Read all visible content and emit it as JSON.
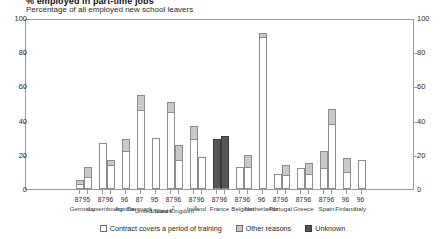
{
  "header": {
    "title_clipped": "% employed in part-time jobs",
    "subtitle": "Percentage of all employed new school leavers"
  },
  "legend": {
    "items": [
      {
        "label": "Contract covers a period of training",
        "swatch": "white",
        "color": "#ffffff"
      },
      {
        "label": "Other reasons",
        "swatch": "gray",
        "color": "#c9c9c9"
      },
      {
        "label": "Unknown",
        "swatch": "dark",
        "color": "#565656"
      }
    ]
  },
  "chart_data": {
    "type": "bar",
    "title": "% employed in part-time jobs",
    "subtitle": "Percentage of all employed new school leavers",
    "xlabel": "",
    "ylabel": "Percentage of all employed new school leavers",
    "ylim": [
      0,
      100
    ],
    "yticks": [
      0,
      20,
      40,
      60,
      80,
      100
    ],
    "ylim_right": [
      0,
      100
    ],
    "yticks_right": [
      0,
      20,
      40,
      60,
      80,
      100
    ],
    "grid": false,
    "stacked": true,
    "legend_position": "bottom",
    "series": [
      {
        "name": "Contract covers a period of training",
        "color": "#ffffff"
      },
      {
        "name": "Other reasons",
        "color": "#c9c9c9"
      },
      {
        "name": "Unknown",
        "color": "#565656"
      }
    ],
    "groups": [
      {
        "country": "Germany",
        "bars": [
          {
            "year": "87",
            "training": 3,
            "other": 2,
            "unknown": 0,
            "total": 5
          },
          {
            "year": "95",
            "training": 7,
            "other": 6,
            "unknown": 0,
            "total": 13
          }
        ]
      },
      {
        "country": "Luxembourg",
        "bars": [
          {
            "year": "87",
            "training": 27,
            "other": 0,
            "unknown": 0,
            "total": 27
          },
          {
            "year": "96",
            "training": 14,
            "other": 3,
            "unknown": 0,
            "total": 17
          }
        ]
      },
      {
        "country": "Austria",
        "bars": [
          {
            "year": "96",
            "training": 22,
            "other": 7,
            "unknown": 0,
            "total": 29
          }
        ]
      },
      {
        "country": "Denmark",
        "bars": [
          {
            "year": "87",
            "training": 46,
            "other": 9,
            "unknown": 0,
            "total": 55
          }
        ]
      },
      {
        "country": "United States",
        "footnote": "2",
        "bars": [
          {
            "year": "95",
            "training": 30,
            "other": 0,
            "unknown": 0,
            "total": 30
          }
        ]
      },
      {
        "country": "United Kingdom",
        "footnote": "2",
        "bars": [
          {
            "year": "87",
            "training": 45,
            "other": 6,
            "unknown": 0,
            "total": 51
          },
          {
            "year": "96",
            "training": 17,
            "other": 9,
            "unknown": 0,
            "total": 26
          }
        ]
      },
      {
        "country": "Ireland",
        "bars": [
          {
            "year": "87",
            "training": 29,
            "other": 8,
            "unknown": 0,
            "total": 37
          },
          {
            "year": "96",
            "training": 19,
            "other": 0,
            "unknown": 0,
            "total": 19
          }
        ]
      },
      {
        "country": "France",
        "bars": [
          {
            "year": "87",
            "training": 0,
            "other": 0,
            "unknown": 29,
            "total": 29
          },
          {
            "year": "96",
            "training": 0,
            "other": 0,
            "unknown": 31,
            "total": 31
          }
        ]
      },
      {
        "country": "Belgium",
        "bars": [
          {
            "year": "87",
            "training": 13,
            "other": 0,
            "unknown": 0,
            "total": 13
          },
          {
            "year": "96",
            "training": 13,
            "other": 7,
            "unknown": 0,
            "total": 20
          }
        ]
      },
      {
        "country": "Netherlands",
        "bars": [
          {
            "year": "96",
            "training": 89,
            "other": 2,
            "unknown": 0,
            "total": 91
          }
        ]
      },
      {
        "country": "Portugal",
        "bars": [
          {
            "year": "87",
            "training": 9,
            "other": 0,
            "unknown": 0,
            "total": 9
          },
          {
            "year": "96",
            "training": 8,
            "other": 6,
            "unknown": 0,
            "total": 14
          }
        ]
      },
      {
        "country": "Greece",
        "bars": [
          {
            "year": "87",
            "training": 12,
            "other": 0,
            "unknown": 0,
            "total": 12
          },
          {
            "year": "96",
            "training": 9,
            "other": 6,
            "unknown": 0,
            "total": 15
          }
        ]
      },
      {
        "country": "Spain",
        "bars": [
          {
            "year": "87",
            "training": 12,
            "other": 10,
            "unknown": 0,
            "total": 22
          },
          {
            "year": "96",
            "training": 38,
            "other": 9,
            "unknown": 0,
            "total": 47
          }
        ]
      },
      {
        "country": "Finland",
        "bars": [
          {
            "year": "96",
            "training": 10,
            "other": 8,
            "unknown": 0,
            "total": 18
          }
        ]
      },
      {
        "country": "Italy",
        "bars": [
          {
            "year": "96",
            "training": 17,
            "other": 0,
            "unknown": 0,
            "total": 17
          }
        ]
      }
    ]
  }
}
